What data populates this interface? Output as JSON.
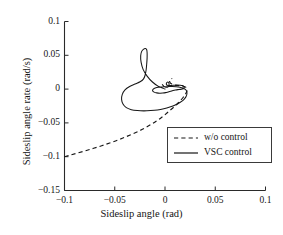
{
  "chart_data": {
    "type": "line",
    "title": "",
    "xlabel": "Sideslip angle (rad)",
    "ylabel": "Sideslip angle rate (rad/s)",
    "xlim": [
      -0.1,
      0.1
    ],
    "ylim": [
      -0.15,
      0.1
    ],
    "xticks": [
      -0.1,
      -0.05,
      0,
      0.05,
      0.1
    ],
    "xtick_labels": [
      "-0.1",
      "-0.05",
      "0",
      "0.05",
      "0.1"
    ],
    "yticks": [
      0.1,
      0.05,
      0,
      -0.05,
      -0.1,
      -0.15
    ],
    "ytick_labels": [
      "0.1",
      "0.05",
      "0",
      "-0.05",
      "-0.1",
      "-0.15"
    ],
    "grid": false,
    "legend_position": "center-right",
    "series": [
      {
        "name": "w/o control",
        "style": "dashed",
        "color": "#171717",
        "points": [
          [
            -0.1,
            -0.1
          ],
          [
            -0.094,
            -0.0975
          ],
          [
            -0.087,
            -0.0946
          ],
          [
            -0.079,
            -0.0912
          ],
          [
            -0.071,
            -0.0876
          ],
          [
            -0.063,
            -0.0838
          ],
          [
            -0.055,
            -0.0797
          ],
          [
            -0.047,
            -0.0754
          ],
          [
            -0.04,
            -0.0712
          ],
          [
            -0.033,
            -0.0668
          ],
          [
            -0.026,
            -0.0621
          ],
          [
            -0.02,
            -0.0574
          ],
          [
            -0.014,
            -0.0524
          ],
          [
            -0.0085,
            -0.0472
          ],
          [
            -0.0035,
            -0.0419
          ],
          [
            0.001,
            -0.0366
          ],
          [
            0.005,
            -0.0315
          ],
          [
            0.0088,
            -0.0266
          ],
          [
            0.0122,
            -0.0218
          ],
          [
            0.0152,
            -0.0172
          ],
          [
            0.0178,
            -0.0128
          ],
          [
            0.0198,
            -0.0088
          ],
          [
            0.0212,
            -0.0052
          ],
          [
            0.0219,
            -0.0021
          ],
          [
            0.0219,
            0.0004
          ],
          [
            0.0212,
            0.0022
          ],
          [
            0.0198,
            0.0034
          ],
          [
            0.0178,
            0.0042
          ],
          [
            0.0152,
            0.0048
          ],
          [
            0.0122,
            0.0054
          ],
          [
            0.0092,
            0.0062
          ],
          [
            0.0068,
            0.0074
          ],
          [
            0.0052,
            0.0092
          ],
          [
            0.0046,
            0.0112
          ],
          [
            0.0048,
            0.0132
          ],
          [
            0.0058,
            0.0148
          ],
          [
            0.0072,
            0.0158
          ]
        ]
      },
      {
        "name": "VSC control",
        "style": "solid",
        "color": "#171717",
        "points": [
          [
            0.0,
            0.0
          ],
          [
            -0.0065,
            0.004
          ],
          [
            -0.0125,
            0.0105
          ],
          [
            -0.0178,
            0.0192
          ],
          [
            -0.0218,
            0.0292
          ],
          [
            -0.0238,
            0.0398
          ],
          [
            -0.0242,
            0.0492
          ],
          [
            -0.0232,
            0.0558
          ],
          [
            -0.0212,
            0.0592
          ],
          [
            -0.0195,
            0.06
          ],
          [
            -0.0182,
            0.0582
          ],
          [
            -0.0178,
            0.0535
          ],
          [
            -0.0178,
            0.0462
          ],
          [
            -0.0182,
            0.0372
          ],
          [
            -0.0188,
            0.0282
          ],
          [
            -0.0198,
            0.0205
          ],
          [
            -0.0215,
            0.0148
          ],
          [
            -0.0248,
            0.0108
          ],
          [
            -0.0298,
            0.0075
          ],
          [
            -0.0352,
            0.0038
          ],
          [
            -0.0398,
            -0.0012
          ],
          [
            -0.0425,
            -0.0078
          ],
          [
            -0.0432,
            -0.0152
          ],
          [
            -0.0418,
            -0.0222
          ],
          [
            -0.0385,
            -0.0275
          ],
          [
            -0.0335,
            -0.0305
          ],
          [
            -0.0275,
            -0.0318
          ],
          [
            -0.021,
            -0.0322
          ],
          [
            -0.0142,
            -0.0318
          ],
          [
            -0.0075,
            -0.0308
          ],
          [
            -0.0012,
            -0.029
          ],
          [
            0.0048,
            -0.0265
          ],
          [
            0.0102,
            -0.0235
          ],
          [
            0.0148,
            -0.0198
          ],
          [
            0.0185,
            -0.0158
          ],
          [
            0.0208,
            -0.0115
          ],
          [
            0.0218,
            -0.0072
          ],
          [
            0.0216,
            -0.0034
          ],
          [
            0.0202,
            -0.0005
          ],
          [
            0.0178,
            0.0015
          ],
          [
            0.0148,
            0.0028
          ],
          [
            0.0112,
            0.0035
          ],
          [
            0.0072,
            0.0038
          ],
          [
            0.0032,
            0.0038
          ],
          [
            -0.0008,
            0.0035
          ],
          [
            -0.0048,
            0.003
          ],
          [
            -0.0082,
            0.0022
          ],
          [
            -0.0108,
            0.001
          ],
          [
            -0.0122,
            -0.0008
          ],
          [
            -0.0122,
            -0.0028
          ],
          [
            -0.0108,
            -0.0045
          ],
          [
            -0.0082,
            -0.0056
          ],
          [
            -0.0052,
            -0.006
          ],
          [
            -0.0022,
            -0.0058
          ],
          [
            0.0006,
            -0.0052
          ],
          [
            0.0032,
            -0.0042
          ],
          [
            0.0056,
            -0.0032
          ],
          [
            0.008,
            -0.0022
          ],
          [
            0.0104,
            -0.0014
          ],
          [
            0.0128,
            -0.0008
          ],
          [
            0.0152,
            -0.0004
          ],
          [
            0.0172,
            0.0002
          ],
          [
            0.0186,
            0.0012
          ],
          [
            0.0192,
            0.0026
          ],
          [
            0.0188,
            0.004
          ],
          [
            0.0174,
            0.0052
          ],
          [
            0.0152,
            0.0058
          ],
          [
            0.0124,
            0.006
          ],
          [
            0.0094,
            0.0058
          ],
          [
            0.0066,
            0.0054
          ],
          [
            0.004,
            0.0052
          ],
          [
            0.0022,
            0.0056
          ],
          [
            0.0014,
            0.0068
          ],
          [
            0.0014,
            0.0084
          ],
          [
            0.002,
            0.0098
          ],
          [
            0.0028,
            0.0104
          ],
          [
            0.0036,
            0.0098
          ],
          [
            0.004,
            0.0082
          ],
          [
            0.004,
            0.0062
          ],
          [
            0.0036,
            0.0044
          ],
          [
            0.0028,
            0.0032
          ],
          [
            0.0016,
            0.0028
          ],
          [
            0.0002,
            0.0032
          ],
          [
            -0.0012,
            0.0044
          ],
          [
            -0.0022,
            0.0058
          ],
          [
            -0.0026,
            0.0066
          ]
        ]
      }
    ]
  },
  "axes": {
    "x_title": "Sideslip angle (rad)",
    "y_title": "Sideslip angle rate (rad/s)"
  },
  "legend": {
    "entries": [
      {
        "label": "w/o control",
        "style": "dashed"
      },
      {
        "label": "VSC control",
        "style": "solid"
      }
    ]
  }
}
